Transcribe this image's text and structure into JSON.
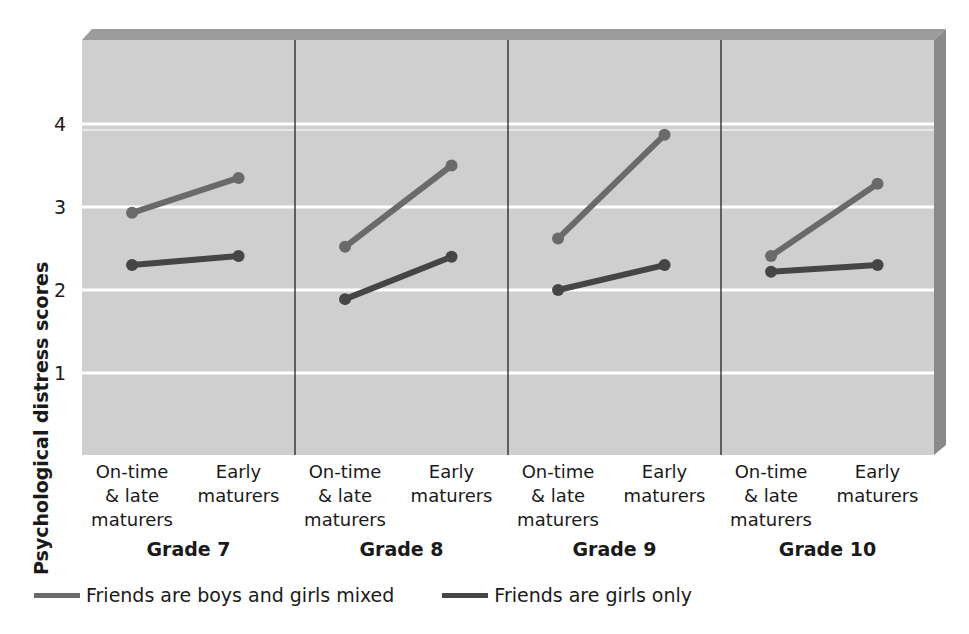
{
  "chart_data": {
    "type": "line",
    "title": "",
    "ylabel": "Psychological distress scores",
    "xlabel": "",
    "ylim": [
      0,
      5
    ],
    "yticks": [
      1,
      2,
      3,
      4
    ],
    "grid": true,
    "legend_position": "bottom-left",
    "groups": [
      "Grade 7",
      "Grade 8",
      "Grade 9",
      "Grade 10"
    ],
    "categories": [
      "On-time & late maturers",
      "Early maturers"
    ],
    "category_label_lines": [
      [
        "On-time",
        "& late",
        "maturers"
      ],
      [
        "Early",
        "maturers"
      ]
    ],
    "series": [
      {
        "name": "Friends are boys and girls mixed",
        "color": "#6a6a6a",
        "values": {
          "Grade 7": [
            2.93,
            3.35
          ],
          "Grade 8": [
            2.52,
            3.5
          ],
          "Grade 9": [
            2.62,
            3.87
          ],
          "Grade 10": [
            2.41,
            3.28
          ]
        }
      },
      {
        "name": "Friends are girls only",
        "color": "#454545",
        "values": {
          "Grade 7": [
            2.3,
            2.41
          ],
          "Grade 8": [
            1.89,
            2.4
          ],
          "Grade 9": [
            2.0,
            2.3
          ],
          "Grade 10": [
            2.22,
            2.3
          ]
        }
      }
    ]
  },
  "colors": {
    "plot_bg": "#cfcfcf",
    "top_band": "#9c9c9c",
    "right_band": "#8a8a8a",
    "gridline": "#ffffff",
    "divider": "#111111"
  }
}
